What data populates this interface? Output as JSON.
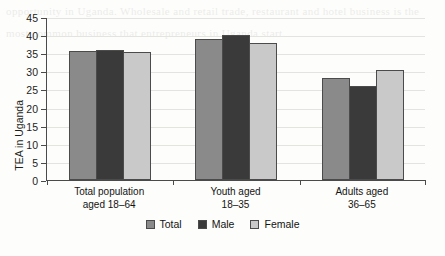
{
  "chart_data": {
    "type": "bar",
    "title": "",
    "xlabel": "",
    "ylabel": "TEA in Uganda",
    "ylim": [
      0,
      45
    ],
    "yticks": [
      0,
      5,
      10,
      15,
      20,
      25,
      30,
      35,
      40,
      45
    ],
    "grid": true,
    "legend_position": "bottom",
    "categories": [
      "Total population\naged 18–64",
      "Youth aged\n18–35",
      "Adults aged\n36–65"
    ],
    "category_lines": [
      [
        "Total population",
        "aged 18–64"
      ],
      [
        "Youth aged",
        "18–35"
      ],
      [
        "Adults aged",
        "36–65"
      ]
    ],
    "series": [
      {
        "name": "Total",
        "color": "#8a8a8a",
        "values": [
          35.5,
          38.8,
          28.1
        ]
      },
      {
        "name": "Male",
        "color": "#3a3a3a",
        "values": [
          35.8,
          40.1,
          26.0
        ]
      },
      {
        "name": "Female",
        "color": "#c9c9c9",
        "values": [
          35.3,
          37.7,
          30.5
        ]
      }
    ]
  },
  "yaxis": {
    "labels": [
      "45",
      "40",
      "35",
      "30",
      "25",
      "20",
      "15",
      "10",
      "5",
      "0"
    ],
    "title": "TEA in Uganda"
  },
  "legend": {
    "items": [
      {
        "label": "Total",
        "color": "#8a8a8a"
      },
      {
        "label": "Male",
        "color": "#3a3a3a"
      },
      {
        "label": "Female",
        "color": "#c9c9c9"
      }
    ]
  },
  "scan_bleed": "opportunity in Uganda. Wholesale and retail trade, restaurant and hotel business is the most common business that entrepreneurs in Uganda start."
}
